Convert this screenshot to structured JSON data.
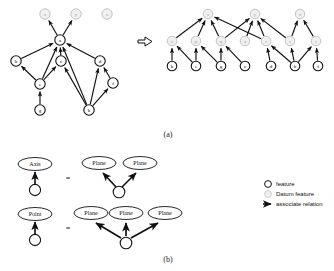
{
  "figure": {
    "captions": {
      "top": "(a)",
      "bottom": "(b)"
    },
    "transform_symbol": "⇒",
    "equals_symbol": "="
  },
  "colors": {
    "feature_fill": "#ffffff",
    "feature_stroke": "#111111",
    "datum_fill": "#f0f0f0",
    "datum_stroke": "#bdbdbd",
    "datum_text": "#9a9a9a",
    "edge": "#111111",
    "text": "#111111"
  },
  "left_graph": {
    "name": "original-association-graph",
    "nodes": [
      {
        "id": "x",
        "label": "x",
        "kind": "datum",
        "x": 45,
        "y": 14
      },
      {
        "id": "y",
        "label": "y",
        "kind": "datum",
        "x": 76,
        "y": 14
      },
      {
        "id": "z",
        "label": "z",
        "kind": "datum",
        "x": 107,
        "y": 14
      },
      {
        "id": "a",
        "label": "a",
        "kind": "feature",
        "x": 60,
        "y": 40
      },
      {
        "id": "b",
        "label": "b",
        "kind": "feature",
        "x": 16,
        "y": 61
      },
      {
        "id": "c",
        "label": "c",
        "kind": "feature",
        "x": 61,
        "y": 61
      },
      {
        "id": "d",
        "label": "d",
        "kind": "feature",
        "x": 100,
        "y": 61
      },
      {
        "id": "e",
        "label": "e",
        "kind": "feature",
        "x": 40,
        "y": 84
      },
      {
        "id": "f",
        "label": "f",
        "kind": "feature",
        "x": 113,
        "y": 83
      },
      {
        "id": "g",
        "label": "g",
        "kind": "feature",
        "x": 40,
        "y": 110
      },
      {
        "id": "h",
        "label": "h",
        "kind": "feature",
        "x": 89,
        "y": 110
      }
    ],
    "edges": [
      {
        "from": "a",
        "to": "x"
      },
      {
        "from": "a",
        "to": "y"
      },
      {
        "from": "b",
        "to": "a"
      },
      {
        "from": "c",
        "to": "a"
      },
      {
        "from": "d",
        "to": "a"
      },
      {
        "from": "e",
        "to": "a"
      },
      {
        "from": "h",
        "to": "a"
      },
      {
        "from": "e",
        "to": "b"
      },
      {
        "from": "e",
        "to": "c"
      },
      {
        "from": "g",
        "to": "e"
      },
      {
        "from": "h",
        "to": "c"
      },
      {
        "from": "h",
        "to": "d"
      },
      {
        "from": "h",
        "to": "f"
      },
      {
        "from": "f",
        "to": "d"
      }
    ]
  },
  "right_graph": {
    "name": "decomposed-association-graph",
    "nodes": [
      {
        "id": "rx",
        "label": "x",
        "kind": "datum",
        "x": 208,
        "y": 14
      },
      {
        "id": "ry",
        "label": "y",
        "kind": "datum",
        "x": 255,
        "y": 14
      },
      {
        "id": "rz",
        "label": "z",
        "kind": "datum",
        "x": 300,
        "y": 14
      },
      {
        "id": "o",
        "label": "o",
        "kind": "datum",
        "x": 172,
        "y": 41
      },
      {
        "id": "p",
        "label": "p",
        "kind": "datum",
        "x": 196,
        "y": 41
      },
      {
        "id": "q",
        "label": "q",
        "kind": "datum",
        "x": 221,
        "y": 41
      },
      {
        "id": "ra",
        "label": "a",
        "kind": "datum",
        "x": 245,
        "y": 41
      },
      {
        "id": "r",
        "label": "r",
        "kind": "datum",
        "x": 266,
        "y": 41
      },
      {
        "id": "s",
        "label": "s",
        "kind": "datum",
        "x": 290,
        "y": 41
      },
      {
        "id": "t",
        "label": "t",
        "kind": "datum",
        "x": 316,
        "y": 41
      },
      {
        "id": "rb",
        "label": "b",
        "kind": "feature",
        "x": 172,
        "y": 66
      },
      {
        "id": "re",
        "label": "e",
        "kind": "feature",
        "x": 196,
        "y": 66
      },
      {
        "id": "rg",
        "label": "g",
        "kind": "feature",
        "x": 221,
        "y": 66
      },
      {
        "id": "rc",
        "label": "c",
        "kind": "feature",
        "x": 245,
        "y": 66
      },
      {
        "id": "rd",
        "label": "d",
        "kind": "feature",
        "x": 271,
        "y": 66
      },
      {
        "id": "rh",
        "label": "h",
        "kind": "feature",
        "x": 295,
        "y": 66
      },
      {
        "id": "rf",
        "label": "f",
        "kind": "feature",
        "x": 318,
        "y": 66
      }
    ],
    "edges": [
      {
        "from": "o",
        "to": "rx"
      },
      {
        "from": "p",
        "to": "rx"
      },
      {
        "from": "q",
        "to": "rx"
      },
      {
        "from": "r",
        "to": "rx"
      },
      {
        "from": "q",
        "to": "ry"
      },
      {
        "from": "ra",
        "to": "ry"
      },
      {
        "from": "r",
        "to": "ry"
      },
      {
        "from": "s",
        "to": "ry"
      },
      {
        "from": "s",
        "to": "rz"
      },
      {
        "from": "t",
        "to": "rz"
      },
      {
        "from": "rb",
        "to": "o"
      },
      {
        "from": "re",
        "to": "o"
      },
      {
        "from": "re",
        "to": "p"
      },
      {
        "from": "rg",
        "to": "p"
      },
      {
        "from": "rg",
        "to": "q"
      },
      {
        "from": "rc",
        "to": "q"
      },
      {
        "from": "rd",
        "to": "r"
      },
      {
        "from": "rh",
        "to": "r"
      },
      {
        "from": "rh",
        "to": "s"
      },
      {
        "from": "rh",
        "to": "t"
      },
      {
        "from": "rf",
        "to": "t"
      }
    ]
  },
  "equivalences": [
    {
      "name": "axis-equivalence",
      "left_label": "Axis",
      "right_labels": [
        "Plane",
        "Plane"
      ]
    },
    {
      "name": "point-equivalence",
      "left_label": "Point",
      "right_labels": [
        "Plane",
        "Plane",
        "Plane"
      ]
    }
  ],
  "legend": {
    "name": "legend",
    "items": [
      {
        "glyph": "feature-circle-icon",
        "label": "feature"
      },
      {
        "glyph": "datum-feature-circle-icon",
        "label": "Datum feature"
      },
      {
        "glyph": "arrow-icon",
        "label": "associate relation"
      }
    ]
  }
}
